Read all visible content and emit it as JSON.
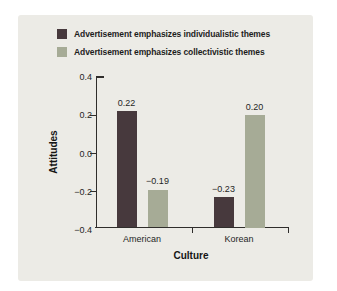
{
  "colors": {
    "panel": "#ecebe6",
    "individualistic_bar": "#47393d",
    "collectivistic_bar": "#a6ab96",
    "axis": "#2f2d2b"
  },
  "legend": {
    "items": [
      {
        "label": "Advertisement emphasizes individualistic themes",
        "color": "#47393d"
      },
      {
        "label": "Advertisement emphasizes collectivistic themes",
        "color": "#a6ab96"
      }
    ]
  },
  "chart_data": {
    "type": "bar",
    "title": "",
    "xlabel": "Culture",
    "ylabel": "Attitudes",
    "categories": [
      "American",
      "Korean"
    ],
    "series": [
      {
        "name": "Advertisement emphasizes individualistic themes",
        "color": "#47393d",
        "values": [
          0.22,
          -0.23
        ],
        "labels": [
          "0.22",
          "−0.23"
        ]
      },
      {
        "name": "Advertisement emphasizes collectivistic themes",
        "color": "#a6ab96",
        "values": [
          -0.19,
          0.2
        ],
        "labels": [
          "−0.19",
          "0.20"
        ]
      }
    ],
    "ylim": [
      -0.4,
      0.4
    ],
    "yticks": {
      "values": [
        0.4,
        0.2,
        0.0,
        -0.2,
        -0.4
      ],
      "labels": [
        "0.4",
        "0.2",
        "0.0",
        "−0.2",
        "−0.4"
      ]
    },
    "bars_baseline": -0.4,
    "grid": false,
    "legend_position": "top"
  }
}
